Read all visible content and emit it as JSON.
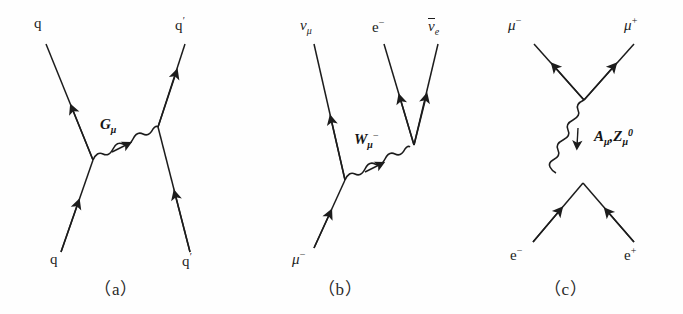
{
  "figure": {
    "background_color": "#fefefe",
    "line_color": "#1c1c1c",
    "width": 683,
    "height": 314
  },
  "panels": [
    {
      "id": "a",
      "caption": "（a）",
      "interaction": "strong",
      "propagator": {
        "name": "gluon",
        "label_base": "G",
        "label_sub": "μ",
        "style": "wavy",
        "orientation": "horizontal"
      },
      "legs": [
        {
          "name": "incoming-quark-upper-left",
          "label_base": "q",
          "label_prime": "",
          "charge": ""
        },
        {
          "name": "outgoing-quark-upper-right",
          "label_base": "q",
          "label_prime": "′",
          "charge": ""
        },
        {
          "name": "incoming-quark-lower-left",
          "label_base": "q",
          "label_prime": "",
          "charge": ""
        },
        {
          "name": "outgoing-quark-lower-right",
          "label_base": "q",
          "label_prime": "′",
          "charge": ""
        }
      ]
    },
    {
      "id": "b",
      "caption": "（b）",
      "interaction": "weak-charged-current",
      "propagator": {
        "name": "w-boson",
        "label_base": "W",
        "label_sub": "μ",
        "label_sup": "−",
        "style": "wavy",
        "orientation": "diagonal"
      },
      "legs": [
        {
          "name": "outgoing-muon-neutrino",
          "label_base": "ν",
          "label_sub": "μ",
          "charge": ""
        },
        {
          "name": "outgoing-electron",
          "label_base": "e",
          "label_sub": "",
          "charge": "−"
        },
        {
          "name": "outgoing-electron-antineutrino",
          "label_base": "ν",
          "label_sub": "e",
          "charge": "",
          "overbar": true
        },
        {
          "name": "incoming-muon",
          "label_base": "μ",
          "label_sub": "",
          "charge": "−"
        }
      ]
    },
    {
      "id": "c",
      "caption": "（c）",
      "interaction": "electroweak-annihilation",
      "propagator": {
        "name": "photon-or-z-boson",
        "label_text": "Aμ, Zμ0",
        "label_a_base": "A",
        "label_a_sub": "μ",
        "label_sep": ",",
        "label_z_base": "Z",
        "label_z_sub": "μ",
        "label_z_sup": "0",
        "style": "wavy",
        "orientation": "vertical"
      },
      "legs": [
        {
          "name": "outgoing-muon",
          "label_base": "μ",
          "charge": "−"
        },
        {
          "name": "outgoing-antimuon",
          "label_base": "μ",
          "charge": "+"
        },
        {
          "name": "incoming-electron",
          "label_base": "e",
          "charge": "−"
        },
        {
          "name": "incoming-positron",
          "label_base": "e",
          "charge": "+"
        }
      ]
    }
  ]
}
